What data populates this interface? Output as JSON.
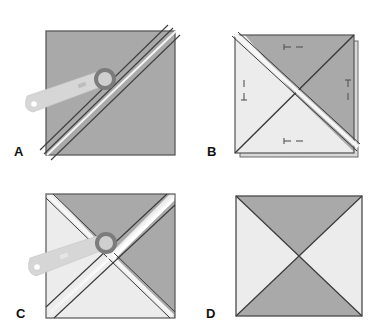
{
  "figure": {
    "colors": {
      "dark_fabric": "#a9a9a9",
      "light_fabric": "#ececec",
      "outline": "#4a4a4a",
      "cutter_handle": "#d6d6d6",
      "cutter_ring": "#7c7c7c",
      "cutter_blade": "#cfcfcf",
      "background": "#ffffff"
    },
    "panels": [
      {
        "id": "A",
        "label": "A",
        "caption": "Rotary cutter slicing a dark square along the diagonal"
      },
      {
        "id": "B",
        "label": "B",
        "caption": "Stacked half-square triangle units with seam marks, diagonal seam"
      },
      {
        "id": "C",
        "label": "C",
        "caption": "Rotary cutter slicing the stacked unit along the second diagonal"
      },
      {
        "id": "D",
        "label": "D",
        "caption": "Finished hourglass block: dark top and bottom, light left and right"
      }
    ]
  }
}
